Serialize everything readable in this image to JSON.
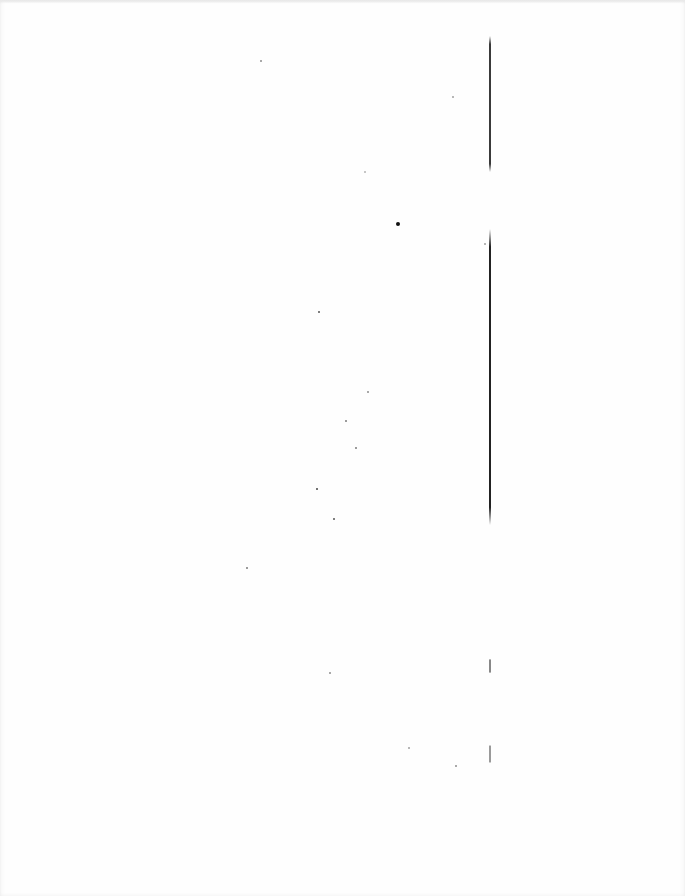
{
  "document": {
    "type": "scanned-page",
    "background": "#fefefe",
    "text_content": ""
  },
  "rules": [
    {
      "x": 489,
      "top": 36,
      "height": 136,
      "color": "#3a3a3a"
    },
    {
      "x": 489,
      "top": 229,
      "height": 296,
      "color": "#222222"
    },
    {
      "x": 489,
      "top": 659,
      "height": 14,
      "color": "#888888"
    },
    {
      "x": 489,
      "top": 745,
      "height": 18,
      "color": "#9a9a9a"
    }
  ],
  "specks": [
    {
      "x": 260,
      "y": 60,
      "size": 1.5,
      "color": "#999999"
    },
    {
      "x": 452,
      "y": 96,
      "size": 1.5,
      "color": "#aaaaaa"
    },
    {
      "x": 364,
      "y": 171,
      "size": 1.5,
      "color": "#bbbbbb"
    },
    {
      "x": 396,
      "y": 222,
      "size": 4,
      "color": "#111111"
    },
    {
      "x": 484,
      "y": 243,
      "size": 1.5,
      "color": "#aaaaaa"
    },
    {
      "x": 318,
      "y": 311,
      "size": 2,
      "color": "#555555"
    },
    {
      "x": 367,
      "y": 391,
      "size": 1.5,
      "color": "#999999"
    },
    {
      "x": 345,
      "y": 420,
      "size": 1.5,
      "color": "#888888"
    },
    {
      "x": 355,
      "y": 447,
      "size": 1.5,
      "color": "#888888"
    },
    {
      "x": 316,
      "y": 488,
      "size": 2,
      "color": "#444444"
    },
    {
      "x": 333,
      "y": 518,
      "size": 2,
      "color": "#555555"
    },
    {
      "x": 246,
      "y": 567,
      "size": 1.5,
      "color": "#888888"
    },
    {
      "x": 329,
      "y": 672,
      "size": 1.5,
      "color": "#999999"
    },
    {
      "x": 408,
      "y": 747,
      "size": 1.5,
      "color": "#aaaaaa"
    },
    {
      "x": 455,
      "y": 765,
      "size": 1.5,
      "color": "#999999"
    }
  ]
}
